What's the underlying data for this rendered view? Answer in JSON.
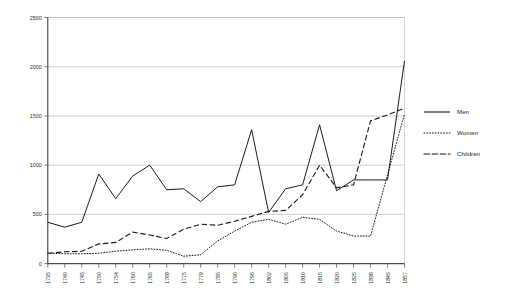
{
  "chart_data": {
    "type": "line",
    "title": "",
    "subtitle": "",
    "xlabel": "",
    "ylabel": "",
    "xlim": [
      0,
      21
    ],
    "ylim": [
      0,
      2500
    ],
    "yticks": [
      0,
      500,
      1000,
      1500,
      2000,
      2500
    ],
    "grid": true,
    "legend_position": "right",
    "categories": [
      "1735",
      "1740",
      "1745",
      "1750",
      "1754",
      "1760",
      "1765",
      "1768",
      "1775",
      "1779",
      "1785",
      "1790",
      "1795",
      "1802",
      "1805",
      "1810",
      "1815",
      "1820",
      "1825",
      "1836",
      "1845",
      "1857"
    ],
    "series": [
      {
        "name": "Men",
        "style": "solid",
        "values": [
          420,
          370,
          420,
          910,
          660,
          890,
          1000,
          750,
          760,
          630,
          780,
          800,
          1360,
          520,
          760,
          800,
          1410,
          740,
          850,
          850,
          850,
          2060
        ]
      },
      {
        "name": "Women",
        "style": "dotted",
        "values": [
          105,
          100,
          100,
          105,
          125,
          140,
          150,
          135,
          75,
          90,
          230,
          330,
          420,
          450,
          400,
          470,
          450,
          330,
          280,
          280,
          900,
          1520
        ]
      },
      {
        "name": "Children",
        "style": "dashed",
        "values": [
          105,
          120,
          125,
          200,
          215,
          320,
          290,
          255,
          350,
          400,
          390,
          430,
          480,
          530,
          540,
          700,
          1000,
          770,
          800,
          1450,
          1510,
          1580
        ]
      }
    ]
  },
  "legend": {
    "entries": [
      {
        "label": "Men",
        "icon": "solid-line-swatch"
      },
      {
        "label": "Women",
        "icon": "dotted-line-swatch"
      },
      {
        "label": "Children",
        "icon": "dashed-line-swatch"
      }
    ]
  }
}
